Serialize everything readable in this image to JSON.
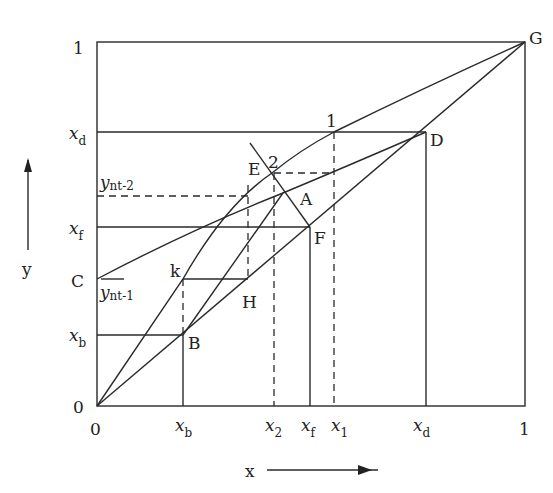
{
  "diagram": {
    "type": "McCabe-Thiele style x-y diagram",
    "axes": {
      "x_label": "x",
      "y_label": "y",
      "x_ticks": [
        {
          "label": "0",
          "sub": ""
        },
        {
          "label": "x",
          "sub": "b"
        },
        {
          "label": "x",
          "sub": "2"
        },
        {
          "label": "x",
          "sub": "f"
        },
        {
          "label": "x",
          "sub": "1"
        },
        {
          "label": "x",
          "sub": "d"
        },
        {
          "label": "1",
          "sub": ""
        }
      ],
      "y_ticks": [
        {
          "label": "0",
          "sub": ""
        },
        {
          "label": "x",
          "sub": "b"
        },
        {
          "label": "x",
          "sub": "f"
        },
        {
          "label": "x",
          "sub": "d"
        },
        {
          "label": "1",
          "sub": ""
        }
      ]
    },
    "points": {
      "G": "G",
      "D": "D",
      "E": "E",
      "two": "2",
      "one": "1",
      "A": "A",
      "F": "F",
      "C": "C",
      "k": "k",
      "H": "H",
      "B": "B"
    },
    "annotations": {
      "y_nt2_main": "y",
      "y_nt2_sub": "nt-2",
      "y_nt1_main": "y",
      "y_nt1_sub": "nt-1"
    }
  }
}
